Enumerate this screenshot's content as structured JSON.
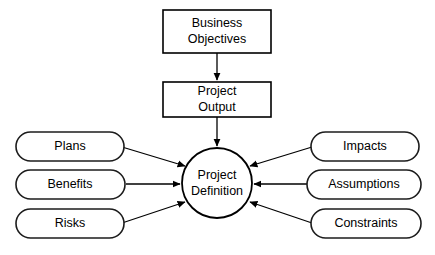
{
  "diagram": {
    "background_color": "#ffffff",
    "line_color": "#000000",
    "text_color": "#000000",
    "nodes": {
      "business_objectives": {
        "label_line1": "Business",
        "label_line2": "Objectives",
        "shape": "rectangle"
      },
      "project_output": {
        "label_line1": "Project",
        "label_line2": "Output",
        "shape": "rectangle"
      },
      "project_definition": {
        "label_line1": "Project",
        "label_line2": "Definition",
        "shape": "circle"
      },
      "plans": {
        "label": "Plans",
        "shape": "rounded-rectangle"
      },
      "benefits": {
        "label": "Benefits",
        "shape": "rounded-rectangle"
      },
      "risks": {
        "label": "Risks",
        "shape": "rounded-rectangle"
      },
      "impacts": {
        "label": "Impacts",
        "shape": "rounded-rectangle"
      },
      "assumptions": {
        "label": "Assumptions",
        "shape": "rounded-rectangle"
      },
      "constraints": {
        "label": "Constraints",
        "shape": "rounded-rectangle"
      }
    },
    "connectors": [
      {
        "from": "business_objectives",
        "to": "project_output",
        "direction": "down",
        "arrowhead": "end"
      },
      {
        "from": "project_output",
        "to": "project_definition",
        "direction": "down",
        "arrowhead": "end"
      },
      {
        "from": "plans",
        "to": "project_definition",
        "direction": "down-right",
        "arrowhead": "end"
      },
      {
        "from": "benefits",
        "to": "project_definition",
        "direction": "right",
        "arrowhead": "end"
      },
      {
        "from": "risks",
        "to": "project_definition",
        "direction": "up-right",
        "arrowhead": "end"
      },
      {
        "from": "impacts",
        "to": "project_definition",
        "direction": "down-left",
        "arrowhead": "end"
      },
      {
        "from": "assumptions",
        "to": "project_definition",
        "direction": "left",
        "arrowhead": "end"
      },
      {
        "from": "constraints",
        "to": "project_definition",
        "direction": "up-left",
        "arrowhead": "end"
      }
    ]
  }
}
